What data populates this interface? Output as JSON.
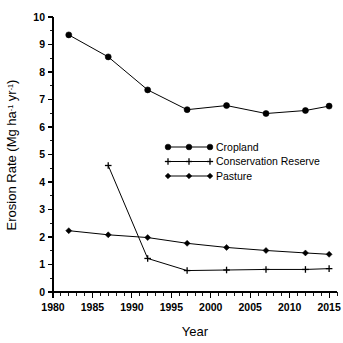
{
  "chart_data": {
    "type": "line",
    "title": "",
    "xlabel": "Year",
    "ylabel": "Erosion Rate (Mg ha-1 yr-1)",
    "ylabel_parts": {
      "prefix": "Erosion Rate (Mg ha",
      "sup1": "-1",
      "middle": " yr",
      "sup2": "-1",
      "suffix": ")"
    },
    "xlim": [
      1980,
      2016
    ],
    "ylim": [
      0,
      10
    ],
    "x_ticks_major": [
      1980,
      1985,
      1990,
      1995,
      2000,
      2005,
      2010,
      2015
    ],
    "x_tick_labels": [
      "1980",
      "1985",
      "1990",
      "1995",
      "2000",
      "2005",
      "2010",
      "2015"
    ],
    "x_minor_step": 1,
    "y_ticks_major": [
      0,
      1,
      2,
      3,
      4,
      5,
      6,
      7,
      8,
      9,
      10
    ],
    "y_tick_labels": [
      "0",
      "1",
      "2",
      "3",
      "4",
      "5",
      "6",
      "7",
      "8",
      "9",
      "10"
    ],
    "y_minor_step": 0.5,
    "grid": false,
    "legend_position": "center-right",
    "series": [
      {
        "name": "Cropland",
        "marker": "circle",
        "x": [
          1982,
          1987,
          1992,
          1997,
          2002,
          2007,
          2012,
          2015
        ],
        "values": [
          9.35,
          8.55,
          7.35,
          6.63,
          6.78,
          6.49,
          6.6,
          6.76
        ]
      },
      {
        "name": "Conservation Reserve",
        "marker": "plus",
        "x": [
          1987,
          1992,
          1997,
          2002,
          2007,
          2012,
          2015
        ],
        "values": [
          4.6,
          1.22,
          0.78,
          0.8,
          0.82,
          0.82,
          0.85
        ]
      },
      {
        "name": "Pasture",
        "marker": "diamond",
        "x": [
          1982,
          1987,
          1992,
          1997,
          2002,
          2007,
          2012,
          2015
        ],
        "values": [
          2.23,
          2.08,
          1.98,
          1.77,
          1.62,
          1.51,
          1.42,
          1.37
        ]
      }
    ]
  },
  "legend": {
    "entries": [
      {
        "label": "Cropland",
        "marker": "circle"
      },
      {
        "label": "Conservation Reserve",
        "marker": "plus"
      },
      {
        "label": "Pasture",
        "marker": "diamond"
      }
    ]
  }
}
